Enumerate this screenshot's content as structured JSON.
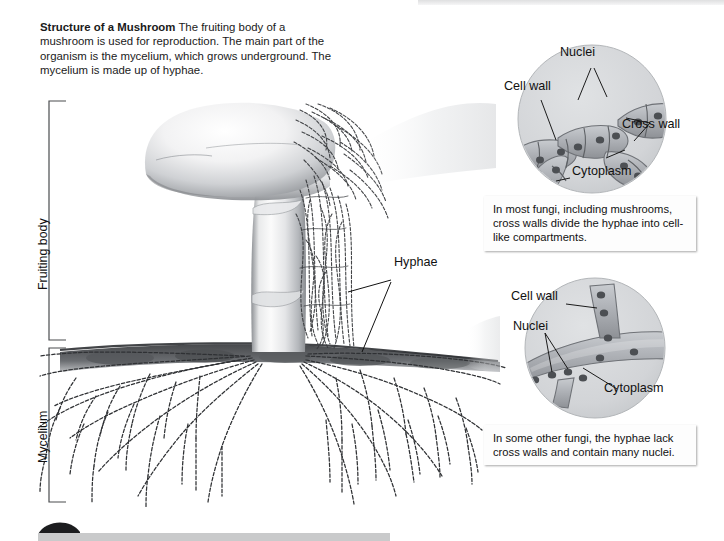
{
  "figure": {
    "title": "Structure of a Mushroom",
    "intro_text": "The fruiting body of a mushroom is used for reproduction. The main part of the organism is the mycelium, which grows underground. The mycelium is made up of hyphae.",
    "type": "labeled-biology-diagram"
  },
  "brackets": [
    {
      "label": "Fruiting body"
    },
    {
      "label": "Mycelium"
    }
  ],
  "main_labels": [
    {
      "label": "Hyphae"
    }
  ],
  "callouts": [
    {
      "id": "septate-hypha",
      "labels": [
        "Nuclei",
        "Cell wall",
        "Cross wall",
        "Cytoplasm"
      ],
      "caption": "In most fungi, including mushrooms, cross walls divide the hyphae into cell-like compartments."
    },
    {
      "id": "coenocytic-hypha",
      "labels": [
        "Cell wall",
        "Nuclei",
        "Cytoplasm"
      ],
      "caption": "In some other fungi, the hyphae lack cross walls and contain many nuclei."
    }
  ],
  "colors": {
    "ink": "#111111",
    "cell_fill": "#b9bcc0",
    "circle_fill": "#d4d6d8",
    "cap_light": "#fefefe",
    "cap_shadow": "#6f7277",
    "soil": "#4a4c4f"
  }
}
